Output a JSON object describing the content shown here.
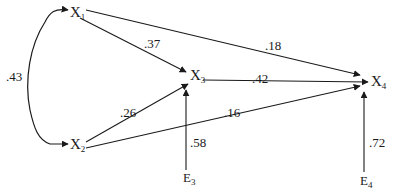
{
  "diagram": {
    "type": "path-diagram",
    "nodes": [
      {
        "id": "X1",
        "base": "X",
        "sub": "1"
      },
      {
        "id": "X2",
        "base": "X",
        "sub": "2"
      },
      {
        "id": "X3",
        "base": "X",
        "sub": "3"
      },
      {
        "id": "X4",
        "base": "X",
        "sub": "4"
      },
      {
        "id": "E3",
        "base": "E",
        "sub": "3"
      },
      {
        "id": "E4",
        "base": "E",
        "sub": "4"
      }
    ],
    "edges": [
      {
        "from": "X1",
        "to": "X2",
        "kind": "correlation",
        "label": ".43"
      },
      {
        "from": "X1",
        "to": "X3",
        "kind": "path",
        "label": ".37"
      },
      {
        "from": "X1",
        "to": "X4",
        "kind": "path",
        "label": ".18"
      },
      {
        "from": "X3",
        "to": "X4",
        "kind": "path",
        "label": ".42"
      },
      {
        "from": "X2",
        "to": "X3",
        "kind": "path",
        "label": ".26"
      },
      {
        "from": "X2",
        "to": "X4",
        "kind": "path",
        "label": ".16"
      },
      {
        "from": "E3",
        "to": "X3",
        "kind": "error",
        "label": ".58"
      },
      {
        "from": "E4",
        "to": "X4",
        "kind": "error",
        "label": ".72"
      }
    ]
  }
}
